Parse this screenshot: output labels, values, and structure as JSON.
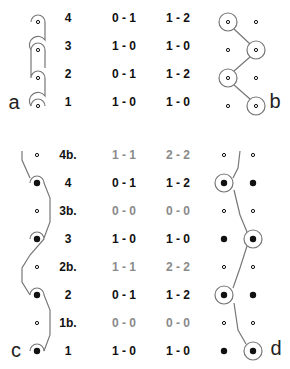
{
  "panels": {
    "a": {
      "letter": "a"
    },
    "b": {
      "letter": "b"
    },
    "c": {
      "letter": "c"
    },
    "d": {
      "letter": "d"
    }
  },
  "top_rows": [
    {
      "label": "4",
      "score1": "0 - 1",
      "score2": "1 - 2",
      "dim": false,
      "y": 18
    },
    {
      "label": "3",
      "score1": "1 - 0",
      "score2": "1 - 0",
      "dim": false,
      "y": 46
    },
    {
      "label": "2",
      "score1": "0 - 1",
      "score2": "1 - 2",
      "dim": false,
      "y": 74
    },
    {
      "label": "1",
      "score1": "1 - 0",
      "score2": "1 - 0",
      "dim": false,
      "y": 102
    }
  ],
  "bottom_rows": [
    {
      "label": "4b.",
      "score1": "1 - 1",
      "score2": "2 - 2",
      "dim": true,
      "y": 155
    },
    {
      "label": "4",
      "score1": "0 - 1",
      "score2": "1 - 2",
      "dim": false,
      "y": 183
    },
    {
      "label": "3b.",
      "score1": "0 - 0",
      "score2": "0 - 0",
      "dim": true,
      "y": 211
    },
    {
      "label": "3",
      "score1": "1 - 0",
      "score2": "1 - 0",
      "dim": false,
      "y": 239
    },
    {
      "label": "2b.",
      "score1": "1 - 1",
      "score2": "2 - 2",
      "dim": true,
      "y": 267
    },
    {
      "label": "2",
      "score1": "0 - 1",
      "score2": "1 - 2",
      "dim": false,
      "y": 295
    },
    {
      "label": "1b.",
      "score1": "0 - 0",
      "score2": "0 - 0",
      "dim": true,
      "y": 323
    },
    {
      "label": "1",
      "score1": "1 - 0",
      "score2": "1 - 0",
      "dim": false,
      "y": 351
    }
  ],
  "colors": {
    "ink": "#111111",
    "dim": "#8a8a8a",
    "line": "#777777"
  }
}
